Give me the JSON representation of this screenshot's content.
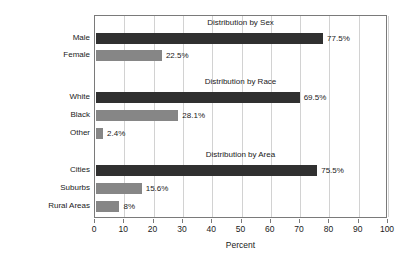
{
  "chart_data": {
    "type": "bar",
    "orientation": "horizontal",
    "title": "",
    "xlabel": "Percent",
    "ylabel": "",
    "xlim": [
      0,
      100
    ],
    "grid": true,
    "legend": null,
    "xticks": [
      "0",
      "10",
      "20",
      "30",
      "40",
      "50",
      "60",
      "70",
      "80",
      "90",
      "100"
    ],
    "xtick_values": [
      0,
      10,
      20,
      30,
      40,
      50,
      60,
      70,
      80,
      90,
      100
    ],
    "groups": [
      {
        "title": "Distribution by Sex",
        "categories": [
          "Male",
          "Female"
        ],
        "values": [
          77.5,
          22.5
        ],
        "labels": [
          "77.5%",
          "22.5%"
        ],
        "colors": [
          "#303030",
          "#868686"
        ]
      },
      {
        "title": "Distribution by Race",
        "categories": [
          "White",
          "Black",
          "Other"
        ],
        "values": [
          69.5,
          28.1,
          2.4
        ],
        "labels": [
          "69.5%",
          "28.1%",
          "2.4%"
        ],
        "colors": [
          "#303030",
          "#868686",
          "#868686"
        ]
      },
      {
        "title": "Distribution by Area",
        "categories": [
          "Cities",
          "Suburbs",
          "Rural Areas"
        ],
        "values": [
          75.5,
          15.6,
          8
        ],
        "labels": [
          "75.5%",
          "15.6%",
          "8%"
        ],
        "colors": [
          "#303030",
          "#868686",
          "#868686"
        ]
      }
    ]
  },
  "colors": {
    "dark_bar": "#303030",
    "light_bar": "#868686",
    "gridline": "#d2d2d2",
    "frame": "#7a7a7a",
    "text": "#1a1a1a",
    "background": "#ffffff"
  }
}
